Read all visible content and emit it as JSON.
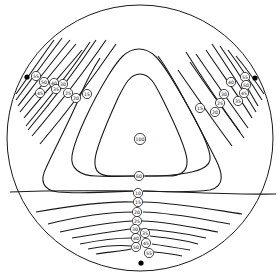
{
  "diagram": {
    "type": "isochromatic contour map on circular disk with three point loads",
    "disk": {
      "cx": 140,
      "cy": 138,
      "r": 133
    },
    "load_points": [
      {
        "name": "left",
        "x": 27,
        "y": 77
      },
      {
        "name": "right",
        "x": 255,
        "y": 78
      },
      {
        "name": "bottom",
        "x": 141,
        "y": 263
      }
    ],
    "labels": {
      "center": [
        {
          "text": "100",
          "x": 140,
          "y": 139
        },
        {
          "text": "60",
          "x": 139,
          "y": 176
        }
      ],
      "left": [
        {
          "text": "55",
          "x": 36,
          "y": 76
        },
        {
          "text": "50",
          "x": 44,
          "y": 82
        },
        {
          "text": "45",
          "x": 40,
          "y": 93
        },
        {
          "text": "40",
          "x": 54,
          "y": 83
        },
        {
          "text": "35",
          "x": 56,
          "y": 89
        },
        {
          "text": "30",
          "x": 63,
          "y": 84
        },
        {
          "text": "25",
          "x": 68,
          "y": 93
        },
        {
          "text": "20",
          "x": 76,
          "y": 98
        },
        {
          "text": "15",
          "x": 87,
          "y": 94
        }
      ],
      "right": [
        {
          "text": "55",
          "x": 245,
          "y": 77
        },
        {
          "text": "50",
          "x": 246,
          "y": 85
        },
        {
          "text": "45",
          "x": 244,
          "y": 93
        },
        {
          "text": "40",
          "x": 231,
          "y": 82
        },
        {
          "text": "35",
          "x": 238,
          "y": 101
        },
        {
          "text": "30",
          "x": 224,
          "y": 94
        },
        {
          "text": "25",
          "x": 220,
          "y": 103
        },
        {
          "text": "20",
          "x": 215,
          "y": 112
        },
        {
          "text": "15",
          "x": 200,
          "y": 108
        }
      ],
      "bottom": [
        {
          "text": "10",
          "x": 138,
          "y": 193
        },
        {
          "text": "15",
          "x": 138,
          "y": 202
        },
        {
          "text": "20",
          "x": 137,
          "y": 212
        },
        {
          "text": "25",
          "x": 137,
          "y": 221
        },
        {
          "text": "30",
          "x": 135,
          "y": 229
        },
        {
          "text": "35",
          "x": 145,
          "y": 233
        },
        {
          "text": "40",
          "x": 136,
          "y": 238
        },
        {
          "text": "45",
          "x": 146,
          "y": 243
        },
        {
          "text": "50",
          "x": 136,
          "y": 247
        },
        {
          "text": "55",
          "x": 149,
          "y": 253
        }
      ]
    }
  }
}
